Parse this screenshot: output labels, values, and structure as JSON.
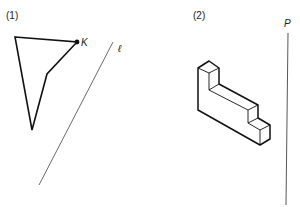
{
  "figure1": {
    "label": "(1)",
    "point_label": "K",
    "line_label": "ℓ",
    "polygon": [
      [
        15,
        37
      ],
      [
        77,
        42
      ],
      [
        47,
        74
      ],
      [
        32,
        130
      ]
    ],
    "line": [
      [
        113,
        42
      ],
      [
        39,
        185
      ]
    ]
  },
  "figure2": {
    "label": "(2)",
    "plane_label": "P",
    "plane_line": [
      [
        288,
        33
      ],
      [
        285,
        205
      ]
    ]
  },
  "colors": {
    "stroke": "#111111",
    "thin": "#444444"
  }
}
